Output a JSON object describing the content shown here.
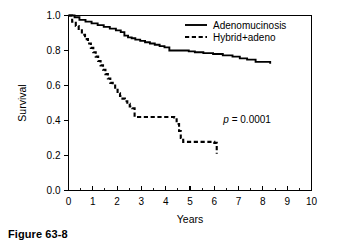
{
  "caption": "Figure 63-8",
  "chart_data": {
    "type": "line",
    "title": "",
    "xlabel": "Years",
    "ylabel": "Survival",
    "xlim": [
      0,
      10
    ],
    "ylim": [
      0.0,
      1.0
    ],
    "xticks": [
      0,
      1,
      2,
      3,
      4,
      5,
      6,
      7,
      8,
      9,
      10
    ],
    "xtick_labels": [
      "0",
      "1",
      "2",
      "3",
      "4",
      "5",
      "6",
      "7",
      "8",
      "9",
      "10"
    ],
    "x_minor_tick_step": 0.5,
    "yticks": [
      0.0,
      0.2,
      0.4,
      0.6,
      0.8,
      1.0
    ],
    "ytick_labels": [
      "0.0",
      "0.2",
      "0.4",
      "0.6",
      "0.8",
      "1.0"
    ],
    "grid": false,
    "legend_position": "top-right",
    "step_type": "post",
    "series": [
      {
        "name": "Adenomucinosis",
        "style": "solid",
        "x": [
          0.0,
          0.25,
          0.45,
          0.7,
          0.95,
          1.2,
          1.45,
          1.7,
          1.95,
          2.15,
          2.3,
          2.45,
          2.6,
          2.75,
          2.95,
          3.15,
          3.35,
          3.55,
          3.75,
          3.95,
          4.15,
          4.95,
          5.2,
          5.55,
          5.95,
          6.35,
          6.75,
          7.05,
          7.35,
          7.7,
          8.3
        ],
        "y": [
          1.0,
          0.99,
          0.975,
          0.965,
          0.955,
          0.945,
          0.935,
          0.925,
          0.915,
          0.905,
          0.885,
          0.875,
          0.87,
          0.862,
          0.855,
          0.847,
          0.84,
          0.833,
          0.825,
          0.818,
          0.8,
          0.795,
          0.79,
          0.785,
          0.78,
          0.772,
          0.765,
          0.755,
          0.748,
          0.735,
          0.725
        ]
      },
      {
        "name": "Hybrid+adeno",
        "style": "dashed",
        "x": [
          0.0,
          0.15,
          0.3,
          0.42,
          0.55,
          0.68,
          0.8,
          0.92,
          1.02,
          1.12,
          1.22,
          1.32,
          1.42,
          1.52,
          1.62,
          1.72,
          1.82,
          1.92,
          2.02,
          2.12,
          2.22,
          2.32,
          2.42,
          2.52,
          2.62,
          2.72,
          4.35,
          4.45,
          4.55,
          4.62,
          4.72,
          6.0,
          6.1
        ],
        "y": [
          1.0,
          0.965,
          0.94,
          0.915,
          0.89,
          0.865,
          0.84,
          0.815,
          0.79,
          0.765,
          0.74,
          0.715,
          0.69,
          0.665,
          0.64,
          0.615,
          0.6,
          0.575,
          0.555,
          0.54,
          0.525,
          0.51,
          0.495,
          0.48,
          0.47,
          0.42,
          0.418,
          0.38,
          0.34,
          0.3,
          0.278,
          0.272,
          0.21
        ]
      }
    ],
    "annotations": [
      {
        "name": "p-value",
        "italic_part": "p",
        "rest": " = 0.0001",
        "x": 7.35,
        "y": 0.385
      }
    ]
  }
}
